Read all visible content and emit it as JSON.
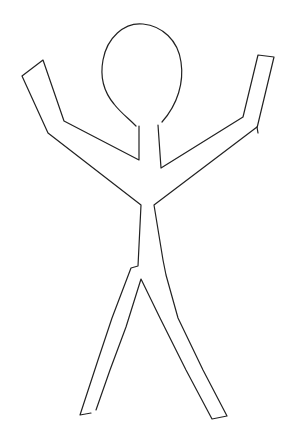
{
  "drawing": {
    "subject": "hand-drawn stick figure with raised arms",
    "background_color": "#ffffff",
    "stroke_color": "#222222"
  }
}
